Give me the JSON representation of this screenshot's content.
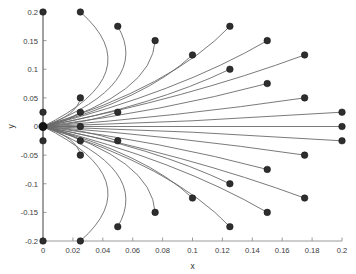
{
  "chart_data": {
    "type": "line",
    "title": "",
    "xlabel": "x",
    "ylabel": "y",
    "xlim": [
      0,
      0.2
    ],
    "ylim": [
      -0.2,
      0.2
    ],
    "grid": false,
    "legend": null,
    "xticks": [
      0,
      0.02,
      0.04,
      0.06,
      0.08,
      0.1,
      0.12,
      0.14,
      0.16,
      0.18,
      0.2
    ],
    "xticklabels": [
      "0",
      "0.02",
      "0.04",
      "0.06",
      "0.08",
      "0.1",
      "0.12",
      "0.14",
      "0.16",
      "0.18",
      "0.2"
    ],
    "yticks": [
      -0.2,
      -0.15,
      -0.1,
      -0.05,
      0,
      0.05,
      0.1,
      0.15,
      0.2
    ],
    "yticklabels": [
      "-0.2",
      "-0.15",
      "-0.1",
      "-0.05",
      "0",
      "0.05",
      "0.1",
      "0.15",
      "0.2"
    ],
    "origin": {
      "x": 0,
      "y": 0
    },
    "series": [
      {
        "name": "traj-01",
        "endpoint": {
          "x": 0.0,
          "y": 0.2
        },
        "bow": 0.0
      },
      {
        "name": "traj-02",
        "endpoint": {
          "x": 0.025,
          "y": 0.2
        },
        "bow": -0.06
      },
      {
        "name": "traj-03",
        "endpoint": {
          "x": 0.05,
          "y": 0.175
        },
        "bow": -0.05
      },
      {
        "name": "traj-04",
        "endpoint": {
          "x": 0.075,
          "y": 0.15
        },
        "bow": -0.04
      },
      {
        "name": "traj-05",
        "endpoint": {
          "x": 0.125,
          "y": 0.175
        },
        "bow": -0.03
      },
      {
        "name": "traj-06",
        "endpoint": {
          "x": 0.1,
          "y": 0.125
        },
        "bow": -0.024
      },
      {
        "name": "traj-07",
        "endpoint": {
          "x": 0.15,
          "y": 0.15
        },
        "bow": -0.022
      },
      {
        "name": "traj-08",
        "endpoint": {
          "x": 0.125,
          "y": 0.1
        },
        "bow": -0.018
      },
      {
        "name": "traj-09",
        "endpoint": {
          "x": 0.175,
          "y": 0.125
        },
        "bow": -0.016
      },
      {
        "name": "traj-10",
        "endpoint": {
          "x": 0.15,
          "y": 0.075
        },
        "bow": -0.012
      },
      {
        "name": "traj-11",
        "endpoint": {
          "x": 0.175,
          "y": 0.05
        },
        "bow": -0.008
      },
      {
        "name": "traj-12",
        "endpoint": {
          "x": 0.025,
          "y": 0.05
        },
        "bow": -0.012
      },
      {
        "name": "traj-13",
        "endpoint": {
          "x": 0.05,
          "y": 0.025
        },
        "bow": -0.008
      },
      {
        "name": "traj-14",
        "endpoint": {
          "x": 0.025,
          "y": 0.025
        },
        "bow": -0.006
      },
      {
        "name": "traj-15",
        "endpoint": {
          "x": 0.0,
          "y": 0.025
        },
        "bow": 0.0
      },
      {
        "name": "traj-16",
        "endpoint": {
          "x": 0.2,
          "y": 0.025
        },
        "bow": -0.005
      },
      {
        "name": "traj-17",
        "endpoint": {
          "x": 0.2,
          "y": 0.0
        },
        "bow": 0.0
      },
      {
        "name": "traj-18",
        "endpoint": {
          "x": 0.025,
          "y": 0.0
        },
        "bow": 0.0
      },
      {
        "name": "traj-19",
        "endpoint": {
          "x": 0.0,
          "y": -0.025
        },
        "bow": 0.0
      },
      {
        "name": "traj-20",
        "endpoint": {
          "x": 0.2,
          "y": -0.025
        },
        "bow": 0.005
      },
      {
        "name": "traj-21",
        "endpoint": {
          "x": 0.025,
          "y": -0.025
        },
        "bow": 0.006
      },
      {
        "name": "traj-22",
        "endpoint": {
          "x": 0.05,
          "y": -0.025
        },
        "bow": 0.008
      },
      {
        "name": "traj-23",
        "endpoint": {
          "x": 0.025,
          "y": -0.05
        },
        "bow": 0.012
      },
      {
        "name": "traj-24",
        "endpoint": {
          "x": 0.175,
          "y": -0.05
        },
        "bow": 0.008
      },
      {
        "name": "traj-25",
        "endpoint": {
          "x": 0.15,
          "y": -0.075
        },
        "bow": 0.012
      },
      {
        "name": "traj-26",
        "endpoint": {
          "x": 0.125,
          "y": -0.1
        },
        "bow": 0.018
      },
      {
        "name": "traj-27",
        "endpoint": {
          "x": 0.175,
          "y": -0.125
        },
        "bow": 0.016
      },
      {
        "name": "traj-28",
        "endpoint": {
          "x": 0.1,
          "y": -0.125
        },
        "bow": 0.024
      },
      {
        "name": "traj-29",
        "endpoint": {
          "x": 0.15,
          "y": -0.15
        },
        "bow": 0.022
      },
      {
        "name": "traj-30",
        "endpoint": {
          "x": 0.075,
          "y": -0.15
        },
        "bow": 0.04
      },
      {
        "name": "traj-31",
        "endpoint": {
          "x": 0.125,
          "y": -0.175
        },
        "bow": 0.03
      },
      {
        "name": "traj-32",
        "endpoint": {
          "x": 0.05,
          "y": -0.175
        },
        "bow": 0.05
      },
      {
        "name": "traj-33",
        "endpoint": {
          "x": 0.025,
          "y": -0.2
        },
        "bow": 0.06
      },
      {
        "name": "traj-34",
        "endpoint": {
          "x": 0.0,
          "y": -0.2
        },
        "bow": 0.0
      }
    ]
  },
  "colors": {
    "line": "#6b6b6b",
    "marker": "#2e2e2e",
    "axis": "#9a9a9a",
    "text": "#3a3a3a",
    "background": "#ffffff"
  }
}
